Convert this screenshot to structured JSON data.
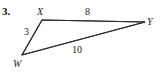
{
  "problem": {
    "number": "3."
  },
  "figure": {
    "type": "triangle",
    "stroke_color": "#2b2b2b",
    "background_color": "#ffffff",
    "vertices": [
      {
        "name": "W",
        "label": "W",
        "x": 22,
        "y": 55
      },
      {
        "name": "X",
        "label": "X",
        "x": 42,
        "y": 20
      },
      {
        "name": "Y",
        "label": "Y",
        "x": 145,
        "y": 22
      }
    ],
    "sides": [
      {
        "name": "WX",
        "from": "W",
        "to": "X",
        "label": "3"
      },
      {
        "name": "XY",
        "from": "X",
        "to": "Y",
        "label": "8"
      },
      {
        "name": "WY",
        "from": "W",
        "to": "Y",
        "label": "10"
      }
    ]
  }
}
